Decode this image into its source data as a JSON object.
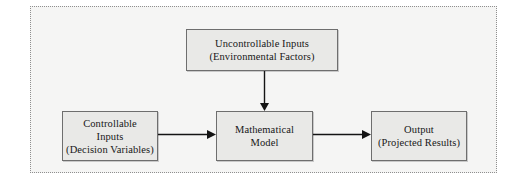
{
  "diagram": {
    "frame": {
      "border_style": "dotted",
      "border_color": "#8f8f8f",
      "background": "#f5f5f4"
    },
    "node_style": {
      "fill": "#e9e9e7",
      "border_color": "#6e6e6e",
      "text_color": "#171717"
    },
    "arrow_color": "#141414",
    "nodes": [
      {
        "id": "uncontrollable-inputs",
        "lines": [
          "Uncontrollable Inputs",
          "(Environmental Factors)"
        ]
      },
      {
        "id": "controllable-inputs",
        "lines": [
          "Controllable",
          "Inputs",
          "(Decision Variables)"
        ]
      },
      {
        "id": "mathematical-model",
        "lines": [
          "Mathematical",
          "Model"
        ]
      },
      {
        "id": "output",
        "lines": [
          "Output",
          "(Projected Results)"
        ]
      }
    ],
    "arrows": [
      {
        "id": "controllable-to-model",
        "from": "controllable-inputs",
        "to": "mathematical-model",
        "direction": "right"
      },
      {
        "id": "model-to-output",
        "from": "mathematical-model",
        "to": "output",
        "direction": "right"
      },
      {
        "id": "uncontrollable-to-model",
        "from": "uncontrollable-inputs",
        "to": "mathematical-model",
        "direction": "down"
      }
    ]
  }
}
